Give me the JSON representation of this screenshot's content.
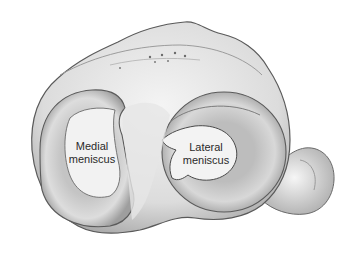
{
  "figure": {
    "colors": {
      "background": "#ffffff",
      "bone_light": "#f1f1f1",
      "bone_mid": "#c9c9c9",
      "bone_shadow": "#8a8a8a",
      "outline": "#5a5a5a",
      "label_text": "#2a2a2a"
    }
  },
  "labels": {
    "medial": {
      "line1": "Medial",
      "line2": "meniscus"
    },
    "lateral": {
      "line1": "Lateral",
      "line2": "meniscus"
    }
  }
}
